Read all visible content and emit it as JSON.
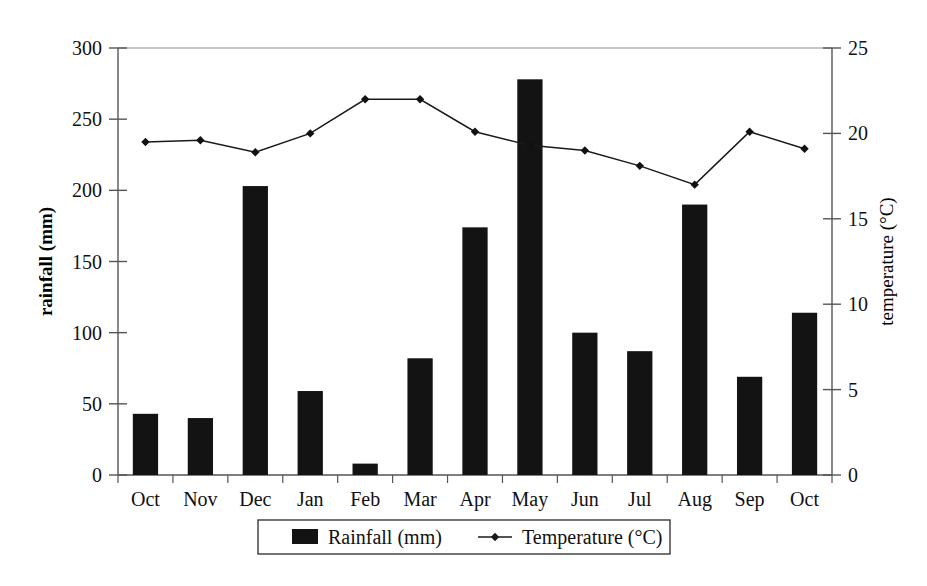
{
  "chart_data": {
    "type": "bar",
    "title": "",
    "subtitle": "",
    "categories": [
      "Oct",
      "Nov",
      "Dec",
      "Jan",
      "Feb",
      "Mar",
      "Apr",
      "May",
      "Jun",
      "Jul",
      "Aug",
      "Sep",
      "Oct"
    ],
    "xlabel": "",
    "ylabel": "rainfall (mm)",
    "y2label": "temperature (°C)",
    "ylim": [
      0,
      300
    ],
    "y2lim": [
      0,
      25
    ],
    "yticks": [
      0,
      50,
      100,
      150,
      200,
      250,
      300
    ],
    "y2ticks": [
      0,
      5,
      10,
      15,
      20,
      25
    ],
    "ytick_labels": [
      "0",
      "50",
      "100",
      "150",
      "200",
      "250",
      "300"
    ],
    "y2tick_labels": [
      "0",
      "5",
      "10",
      "15",
      "20",
      "25"
    ],
    "grid": false,
    "legend_position": "bottom",
    "series": [
      {
        "name": "Rainfall (mm)",
        "type": "bar",
        "axis": "left",
        "color": "#131313",
        "values": [
          43,
          40,
          203,
          59,
          8,
          82,
          174,
          278,
          100,
          87,
          190,
          69,
          114
        ]
      },
      {
        "name": "Temperature (°C)",
        "type": "line",
        "axis": "right",
        "color": "#1a1a1a",
        "marker": "diamond",
        "values": [
          19.5,
          19.6,
          18.9,
          20.0,
          22.0,
          22.0,
          20.1,
          19.3,
          19.0,
          18.1,
          17.0,
          20.1,
          19.1
        ]
      }
    ],
    "legend": [
      {
        "label": "Rainfall (mm)",
        "marker": "square",
        "color": "#131313"
      },
      {
        "label": "Temperature (°C)",
        "marker": "line-diamond",
        "color": "#1a1a1a"
      }
    ]
  }
}
